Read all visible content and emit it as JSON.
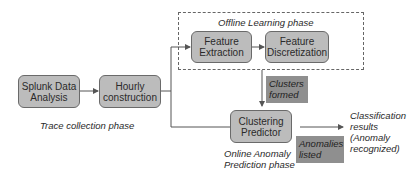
{
  "diagram": {
    "phases": {
      "offline": "Offline Learning phase",
      "trace": "Trace collection phase",
      "online_line1": "Online Anomaly",
      "online_line2": "Prediction phase"
    },
    "nodes": {
      "splunk": {
        "line1": "Splunk Data",
        "line2": "Analysis"
      },
      "hourly": {
        "line1": "Hourly",
        "line2": "construction"
      },
      "feature_extraction": {
        "line1": "Feature",
        "line2": "Extraction"
      },
      "feature_discretization": {
        "line1": "Feature",
        "line2": "Discretization"
      },
      "clustering_predictor": {
        "line1": "Clustering",
        "line2": "Predictor"
      }
    },
    "notes": {
      "clusters": {
        "line1": "Clusters",
        "line2": "formed"
      },
      "anomalies": {
        "line1": "Anomalies",
        "line2": "listed"
      }
    },
    "output": {
      "line1": "Classification",
      "line2": "results",
      "line3": "(Anomaly",
      "line4": "recognized)"
    },
    "edges": [
      "Splunk Data Analysis -> Hourly construction",
      "Hourly construction -> Feature Extraction",
      "Feature Extraction -> Feature Discretization",
      "Offline Learning phase -> Clustering Predictor",
      "Hourly construction -> Clustering Predictor",
      "Clustering Predictor -> Classification results"
    ]
  }
}
